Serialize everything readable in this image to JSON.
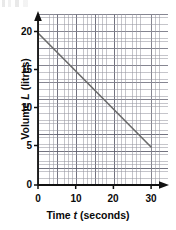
{
  "chart_data": {
    "type": "line",
    "title": "",
    "xlabel": "Time t (seconds)",
    "ylabel": "Volume L (litres)",
    "xlabel_parts": {
      "pre": "Time ",
      "italic": "t",
      "post": " (seconds)"
    },
    "ylabel_parts": {
      "pre": "Volume ",
      "italic": "L",
      "post": " (litres)"
    },
    "xlim": [
      0,
      34.5
    ],
    "ylim": [
      0,
      22.5
    ],
    "xticks": [
      0,
      10,
      20,
      30
    ],
    "xtick_labels": [
      "0",
      "10",
      "20",
      "30"
    ],
    "yticks": [
      0,
      5,
      10,
      15,
      20
    ],
    "ytick_labels": [
      "0",
      "5",
      "10",
      "15",
      "20"
    ],
    "grid": true,
    "grid_minor_step_x": 1,
    "grid_minor_step_y": 0.5,
    "grid_major_step_x": 5,
    "grid_major_step_y": 2.5,
    "legend": null,
    "axis_arrows": true,
    "series": [
      {
        "name": "Volume of water",
        "x": [
          0,
          30
        ],
        "y": [
          20,
          5
        ],
        "color": "#6b6b6b",
        "linewidth": 1.6,
        "slope": -0.5,
        "intercept": 20
      }
    ],
    "colors": {
      "line": "#6b6b6b",
      "axis": "#111111",
      "grid_minor": "#9696a0",
      "grid_major": "#5a5a69",
      "text": "#0a0a0a",
      "background": "#ffffff"
    }
  },
  "ticks": {
    "y": [
      {
        "label": "20",
        "top": 27
      },
      {
        "label": "15",
        "top": 65
      },
      {
        "label": "10",
        "top": 103
      },
      {
        "label": "5",
        "top": 141
      },
      {
        "label": "0",
        "top": 179
      }
    ],
    "x": [
      {
        "label": "0",
        "left": 27
      },
      {
        "label": "10",
        "left": 65
      },
      {
        "label": "20",
        "left": 103
      },
      {
        "label": "30",
        "left": 140
      }
    ]
  }
}
